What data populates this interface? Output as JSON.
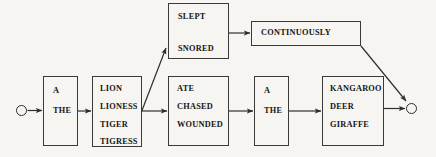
{
  "diagram": {
    "type": "sentence-generation-network",
    "background_color": "#f6f5f1",
    "line_color": "#2e2e2c",
    "text_color": "#141414",
    "terminals": {
      "start_label": "start-node",
      "end_label": "end-node"
    },
    "nodes": [
      {
        "id": "determiner1",
        "name": "determiner-box-1",
        "items": [
          "A",
          "THE"
        ]
      },
      {
        "id": "subject",
        "name": "subject-noun-box",
        "items": [
          "LION",
          "LIONESS",
          "TIGER",
          "TIGRESS"
        ]
      },
      {
        "id": "slept",
        "name": "intransitive-verb-box",
        "items": [
          "SLEPT",
          "SNORED"
        ]
      },
      {
        "id": "continuously",
        "name": "adverb-box",
        "items": [
          "CONTINUOUSLY"
        ]
      },
      {
        "id": "verb",
        "name": "transitive-verb-box",
        "items": [
          "ATE",
          "CHASED",
          "WOUNDED"
        ]
      },
      {
        "id": "determiner2",
        "name": "determiner-box-2",
        "items": [
          "A",
          "THE"
        ]
      },
      {
        "id": "object",
        "name": "object-noun-box",
        "items": [
          "KANGAROO",
          "DEER",
          "GIRAFFE"
        ]
      }
    ],
    "edges": [
      {
        "name": "edge-start-to-determiner1",
        "from": "start-node",
        "to": "determiner1"
      },
      {
        "name": "edge-determiner1-to-subject",
        "from": "determiner1",
        "to": "subject"
      },
      {
        "name": "edge-subject-to-slept",
        "from": "subject",
        "to": "slept"
      },
      {
        "name": "edge-subject-to-verb",
        "from": "subject",
        "to": "verb"
      },
      {
        "name": "edge-slept-to-continuously",
        "from": "slept",
        "to": "continuously"
      },
      {
        "name": "edge-continuously-to-end",
        "from": "continuously",
        "to": "end-node"
      },
      {
        "name": "edge-verb-to-determiner2",
        "from": "verb",
        "to": "determiner2"
      },
      {
        "name": "edge-determiner2-to-object",
        "from": "determiner2",
        "to": "object"
      },
      {
        "name": "edge-object-to-end",
        "from": "object",
        "to": "end-node"
      }
    ]
  }
}
